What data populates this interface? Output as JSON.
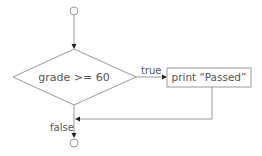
{
  "diagram": {
    "type": "flowchart",
    "start_node": {
      "shape": "circle",
      "label": ""
    },
    "decision": {
      "shape": "diamond",
      "label": "grade >= 60"
    },
    "action": {
      "shape": "rectangle",
      "label": "print “Passed”"
    },
    "end_node": {
      "shape": "circle",
      "label": ""
    },
    "edges": [
      {
        "from": "start_node",
        "to": "decision",
        "label": ""
      },
      {
        "from": "decision",
        "to": "action",
        "label": "true"
      },
      {
        "from": "action",
        "to": "merge",
        "label": ""
      },
      {
        "from": "decision",
        "to": "end_node",
        "label": "false"
      }
    ],
    "colors": {
      "stroke": "#9a9a9a",
      "text": "#555555",
      "arrow": "#222222"
    }
  }
}
